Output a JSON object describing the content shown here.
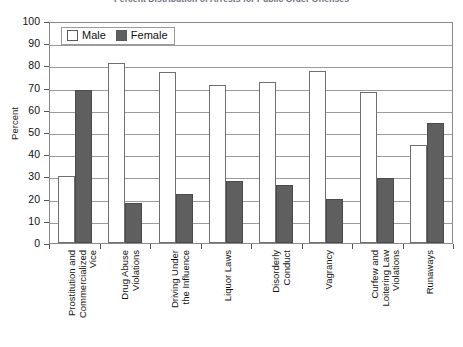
{
  "chart_data": {
    "type": "bar",
    "title": "Percent Distribution of Arrests for Public Order Offenses",
    "xlabel": "",
    "ylabel": "Percent",
    "ylim": [
      0,
      100
    ],
    "ytick_step": 10,
    "yticks": [
      "100",
      "90",
      "80",
      "70",
      "60",
      "50",
      "40",
      "30",
      "20",
      "10",
      "0"
    ],
    "grid": true,
    "legend_position": "top-left",
    "categories": [
      "Prostitution and Commercialized Vice",
      "Drug Abuse Violations",
      "Driving Under the Influence",
      "Liquor Laws",
      "Disorderly Conduct",
      "Vagrancy",
      "Curfew and Loitering Law Violations",
      "Runaways"
    ],
    "category_lines": [
      [
        "Prostitution and",
        "Commercialized",
        "Vice"
      ],
      [
        "Drug Abuse",
        "Violations"
      ],
      [
        "Driving Under",
        "the Influence"
      ],
      [
        "Liquor Laws"
      ],
      [
        "Disorderly",
        "Conduct"
      ],
      [
        "Vagrancy"
      ],
      [
        "Curfew and",
        "Loitering Law",
        "Violations"
      ],
      [
        "Runaways"
      ]
    ],
    "series": [
      {
        "name": "Male",
        "color": "#ffffff",
        "values": [
          30,
          81,
          77,
          71,
          72.5,
          77.5,
          68,
          44
        ]
      },
      {
        "name": "Female",
        "color": "#5f5f5f",
        "values": [
          69,
          18,
          22,
          28,
          26,
          20,
          29.5,
          54
        ]
      }
    ]
  },
  "legend": {
    "items": [
      {
        "label": "Male",
        "swatch": "male-swatch-icon"
      },
      {
        "label": "Female",
        "swatch": "female-swatch-icon"
      }
    ]
  }
}
